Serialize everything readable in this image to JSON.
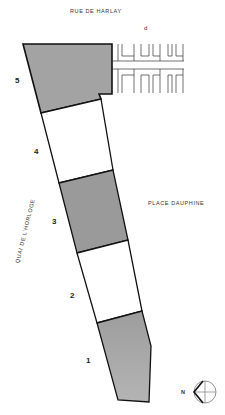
{
  "streets": {
    "north": "RUE DE HARLAY",
    "east": "PLACE DAUPHINE",
    "west": "QUAI DE L'HORLOGE"
  },
  "grid_label": "d",
  "sections": [
    {
      "id": "1",
      "label": "1",
      "shaded": true
    },
    {
      "id": "2",
      "label": "2",
      "shaded": false
    },
    {
      "id": "3",
      "label": "3",
      "shaded": true
    },
    {
      "id": "4",
      "label": "4",
      "shaded": false
    },
    {
      "id": "5",
      "label": "5",
      "shaded": true
    }
  ],
  "north_arrow": {
    "label": "N"
  },
  "colors": {
    "shade": "#a8a8a8",
    "line": "#111111",
    "background": "#ffffff"
  }
}
